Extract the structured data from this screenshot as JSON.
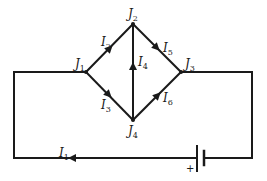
{
  "diagram": {
    "type": "circuit",
    "junctions": [
      {
        "id": "J1",
        "base": "J",
        "sub": "1"
      },
      {
        "id": "J2",
        "base": "J",
        "sub": "2"
      },
      {
        "id": "J3",
        "base": "J",
        "sub": "3"
      },
      {
        "id": "J4",
        "base": "J",
        "sub": "4"
      }
    ],
    "currents": [
      {
        "id": "I1",
        "base": "I",
        "sub": "1",
        "from": "battery",
        "to": "J1",
        "direction": "left along bottom wire"
      },
      {
        "id": "I2",
        "base": "I",
        "sub": "2",
        "from": "J1",
        "to": "J2"
      },
      {
        "id": "I3",
        "base": "I",
        "sub": "3",
        "from": "J1",
        "to": "J4"
      },
      {
        "id": "I4",
        "base": "I",
        "sub": "4",
        "from": "J4",
        "to": "J2"
      },
      {
        "id": "I5",
        "base": "I",
        "sub": "5",
        "from": "J2",
        "to": "J3"
      },
      {
        "id": "I6",
        "base": "I",
        "sub": "6",
        "from": "J4",
        "to": "J3"
      }
    ],
    "battery": {
      "polarity_label": "+"
    },
    "colors": {
      "stroke": "#1a1a1a",
      "background": "#ffffff"
    }
  }
}
